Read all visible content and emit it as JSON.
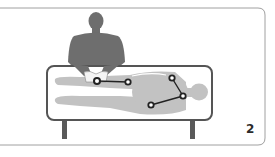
{
  "figure": {
    "panel_number": "2",
    "colors": {
      "frame": "#9a9a9a",
      "practitioner": "#6e6e6e",
      "patient": "#c2c2c2",
      "table_border": "#555555",
      "table_legs": "#5a5a5a",
      "point_line": "#222222"
    },
    "points": [
      {
        "x": 97,
        "y": 81
      },
      {
        "x": 128,
        "y": 82
      },
      {
        "x": 172,
        "y": 78
      },
      {
        "x": 183,
        "y": 96
      },
      {
        "x": 151,
        "y": 105
      }
    ],
    "connections": [
      [
        0,
        1
      ],
      [
        2,
        3
      ],
      [
        3,
        4
      ]
    ]
  }
}
